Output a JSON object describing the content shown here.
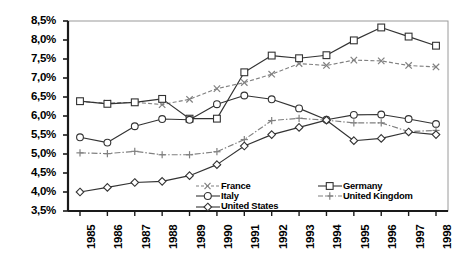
{
  "chart_data": {
    "type": "line",
    "title": "",
    "subtitle": "",
    "xlabel": "",
    "ylabel": "",
    "grid": false,
    "legend_position": "inside-bottom-center",
    "categories": [
      "1985",
      "1986",
      "1987",
      "1988",
      "1989",
      "1990",
      "1991",
      "1992",
      "1993",
      "1994",
      "1995",
      "1996",
      "1997",
      "1998"
    ],
    "x_tick_labels": [
      "1985",
      "1986",
      "1987",
      "1988",
      "1989",
      "1990",
      "1991",
      "1992",
      "1993",
      "1994",
      "1995",
      "1996",
      "1997",
      "1998"
    ],
    "y_tick_labels": [
      "8,5%",
      "8,0%",
      "7,5%",
      "7,0%",
      "6,5%",
      "6,0%",
      "5,5%",
      "5,0%",
      "4,5%",
      "4,0%",
      "3,5%"
    ],
    "y_tick_values": [
      8.5,
      8.0,
      7.5,
      7.0,
      6.5,
      6.0,
      5.5,
      5.0,
      4.5,
      4.0,
      3.5
    ],
    "ylim": [
      3.5,
      8.5
    ],
    "y_unit": "%",
    "xlim": [
      "1985",
      "1998"
    ],
    "series": [
      {
        "name": "France",
        "marker": "x-cross",
        "line_style": "dashed",
        "color": "#808080",
        "values": [
          6.38,
          6.34,
          6.36,
          6.3,
          6.44,
          6.72,
          6.88,
          7.1,
          7.38,
          7.33,
          7.47,
          7.45,
          7.33,
          7.29
        ]
      },
      {
        "name": "Germany",
        "marker": "square",
        "line_style": "solid",
        "color": "#333333",
        "values": [
          6.39,
          6.32,
          6.36,
          6.45,
          5.93,
          5.93,
          7.15,
          7.59,
          7.52,
          7.6,
          7.99,
          8.33,
          8.09,
          7.85
        ]
      },
      {
        "name": "Italy",
        "marker": "circle",
        "line_style": "solid",
        "color": "#333333",
        "values": [
          5.44,
          5.3,
          5.73,
          5.92,
          5.9,
          6.31,
          6.54,
          6.44,
          6.2,
          5.9,
          6.03,
          6.04,
          5.92,
          5.79
        ]
      },
      {
        "name": "United Kingdom",
        "marker": "plus",
        "line_style": "dash-dot",
        "color": "#808080",
        "values": [
          5.03,
          5.01,
          5.07,
          4.98,
          4.98,
          5.06,
          5.38,
          5.88,
          5.94,
          5.89,
          5.82,
          5.82,
          5.59,
          5.62
        ]
      },
      {
        "name": "United States",
        "marker": "diamond",
        "line_style": "solid",
        "color": "#333333",
        "values": [
          4.0,
          4.12,
          4.25,
          4.28,
          4.43,
          4.72,
          5.21,
          5.51,
          5.7,
          5.89,
          5.35,
          5.41,
          5.58,
          5.51
        ]
      }
    ],
    "legend": [
      {
        "label": "France",
        "marker": "x-cross",
        "line_style": "dashed"
      },
      {
        "label": "Germany",
        "marker": "square",
        "line_style": "solid"
      },
      {
        "label": "Italy",
        "marker": "circle",
        "line_style": "solid"
      },
      {
        "label": "United Kingdom",
        "marker": "plus",
        "line_style": "dash-dot"
      },
      {
        "label": "United States",
        "marker": "diamond",
        "line_style": "solid"
      }
    ]
  },
  "legend_grid": {
    "row1": {
      "left": "France",
      "right": "Germany"
    },
    "row2": {
      "left": "Italy",
      "right": "United Kingdom"
    },
    "row3": {
      "left": "United States",
      "right": ""
    }
  }
}
